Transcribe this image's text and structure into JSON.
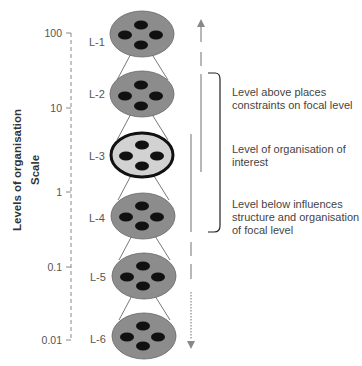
{
  "axis": {
    "title": "Levels of organisation",
    "subtitle": "Scale",
    "ticks": [
      "100",
      "10",
      "1",
      "0.1",
      "0.01"
    ]
  },
  "levels": [
    {
      "label": "L-1",
      "fill": "#8c8c8c",
      "focal": false
    },
    {
      "label": "L-2",
      "fill": "#8c8c8c",
      "focal": false
    },
    {
      "label": "L-3",
      "fill": "#d2d2d2",
      "focal": true
    },
    {
      "label": "L-4",
      "fill": "#8c8c8c",
      "focal": false
    },
    {
      "label": "L-5",
      "fill": "#8c8c8c",
      "focal": false
    },
    {
      "label": "L-6",
      "fill": "#8c8c8c",
      "focal": false
    }
  ],
  "annotations": {
    "above": "Level above places constraints on focal level",
    "focal": "Level of organisation of interest",
    "below": "Level below influences structure and organisation of focal level"
  },
  "colors": {
    "circle_fill": "#8c8c8c",
    "focal_fill": "#d2d2d2",
    "nucleus": "#111111",
    "line": "#888888",
    "bracket": "#222222"
  }
}
